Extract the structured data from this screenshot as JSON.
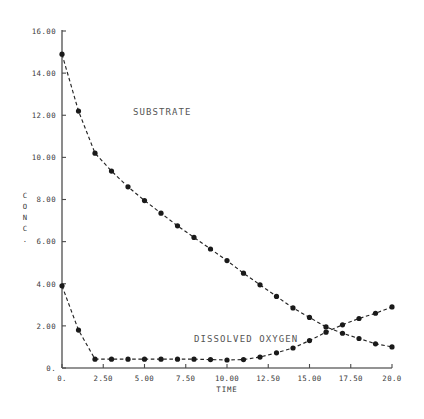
{
  "chart_data": {
    "type": "line",
    "title": "",
    "xlabel": "TIME",
    "ylabel": "CONC.",
    "xlim": [
      0,
      20
    ],
    "ylim": [
      0,
      16
    ],
    "grid": false,
    "legend_position": "inline-annotation",
    "xticks": [
      0,
      2.5,
      5,
      7.5,
      10,
      12.5,
      15,
      17.5,
      20
    ],
    "xtick_labels": [
      "0.",
      "2.50",
      "5.00",
      "7.50",
      "10.00",
      "12.50",
      "15.00",
      "17.50",
      "20.0"
    ],
    "yticks": [
      0,
      2,
      4,
      6,
      8,
      10,
      12,
      14,
      16
    ],
    "ytick_labels": [
      "0.",
      "2.00",
      "4.00",
      "6.00",
      "8.00",
      "10.00",
      "12.00",
      "14.00",
      "16.00"
    ],
    "ylabel_chars": [
      "C",
      "O",
      "N",
      "C",
      "."
    ],
    "series": [
      {
        "name": "SUBSTRATE",
        "label_x": 4.3,
        "label_y": 12.0,
        "marker": "filled-circle",
        "linestyle": "dashed",
        "color": "#1a1a1a",
        "x": [
          0,
          1,
          2,
          3,
          4,
          5,
          6,
          7,
          8,
          9,
          10,
          11,
          12,
          13,
          14,
          15,
          16,
          17,
          18,
          19,
          20
        ],
        "y": [
          14.9,
          12.2,
          10.2,
          9.35,
          8.6,
          7.95,
          7.35,
          6.75,
          6.2,
          5.65,
          5.1,
          4.5,
          3.95,
          3.4,
          2.85,
          2.4,
          1.95,
          1.65,
          1.4,
          1.15,
          1.0
        ]
      },
      {
        "name": "DISSOLVED OXYGEN",
        "label_x": 8.0,
        "label_y": 1.25,
        "marker": "filled-circle",
        "linestyle": "dashed",
        "color": "#1a1a1a",
        "x": [
          0,
          1,
          2,
          3,
          4,
          5,
          6,
          7,
          8,
          9,
          10,
          11,
          12,
          13,
          14,
          15,
          16,
          17,
          18,
          19,
          20
        ],
        "y": [
          3.9,
          1.8,
          0.42,
          0.42,
          0.42,
          0.42,
          0.42,
          0.42,
          0.42,
          0.4,
          0.38,
          0.4,
          0.52,
          0.72,
          0.95,
          1.3,
          1.7,
          2.05,
          2.35,
          2.6,
          2.9
        ]
      }
    ],
    "annotations": [
      {
        "text": "SUBSTRATE"
      },
      {
        "text": "DISSOLVED OXYGEN"
      }
    ]
  }
}
